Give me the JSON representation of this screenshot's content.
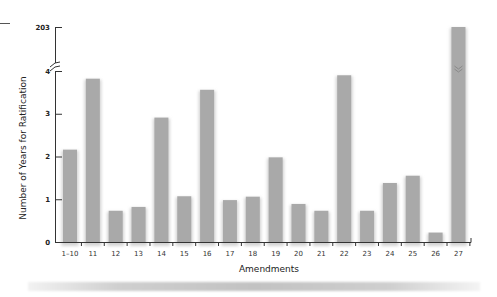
{
  "chart_data": {
    "type": "bar",
    "title": "",
    "xlabel": "Amendments",
    "ylabel": "Number of Years for Ratification",
    "categories": [
      "1–10",
      "11",
      "12",
      "13",
      "14",
      "15",
      "16",
      "17",
      "18",
      "19",
      "20",
      "21",
      "22",
      "23",
      "24",
      "25",
      "26",
      "27"
    ],
    "values": [
      2.16,
      3.82,
      0.73,
      0.82,
      2.91,
      1.07,
      3.56,
      0.98,
      1.06,
      1.98,
      0.89,
      0.73,
      3.9,
      0.73,
      1.38,
      1.55,
      0.22,
      203
    ],
    "yticks": [
      0,
      1,
      2,
      3,
      4,
      203
    ],
    "ylim": [
      0,
      4
    ],
    "axis_break": {
      "between": [
        4,
        203
      ],
      "symbol": "double-slash"
    },
    "grid": false,
    "legend": null,
    "bar_color": "#a9a9a9",
    "annotations": [
      "Bar for amendment 27 extends past the axis break to 203"
    ]
  },
  "axis": {
    "xlabel": "Amendments",
    "ylabel": "Number of Years for Ratification"
  }
}
